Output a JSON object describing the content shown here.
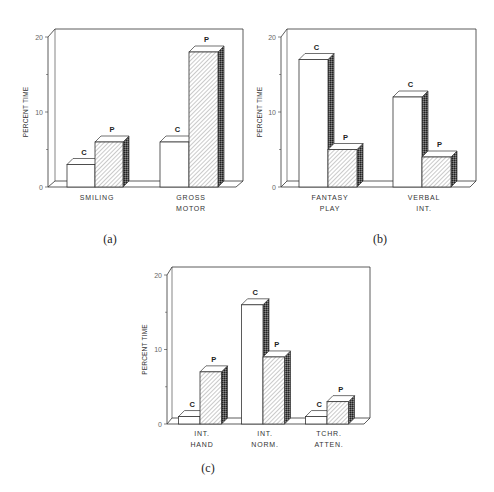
{
  "chart_data": [
    {
      "id": "a",
      "type": "bar",
      "caption": "(a)",
      "title": "",
      "xlabel": "",
      "ylabel": "PERCENT TIME",
      "ylim": [
        0,
        20
      ],
      "yticks": [
        "0",
        "10",
        "20"
      ],
      "categories": [
        "SMILING",
        "GROSS MOTOR"
      ],
      "category_lines": [
        [
          "SMILING"
        ],
        [
          "GROSS",
          "MOTOR"
        ]
      ],
      "series": [
        {
          "name": "C",
          "style": "white",
          "values": [
            3,
            6
          ]
        },
        {
          "name": "P",
          "style": "hatched",
          "values": [
            6,
            18
          ]
        }
      ],
      "grid": false,
      "legend": "bar-top letters"
    },
    {
      "id": "b",
      "type": "bar",
      "caption": "(b)",
      "title": "",
      "xlabel": "",
      "ylabel": "PERCENT TIME",
      "ylim": [
        0,
        20
      ],
      "yticks": [
        "0",
        "10",
        "20"
      ],
      "categories": [
        "FANTASY PLAY",
        "VERBAL INT."
      ],
      "category_lines": [
        [
          "FANTASY",
          "PLAY"
        ],
        [
          "VERBAL",
          "INT."
        ]
      ],
      "series": [
        {
          "name": "C",
          "style": "white",
          "values": [
            17,
            12
          ]
        },
        {
          "name": "P",
          "style": "hatched",
          "values": [
            5,
            4
          ]
        }
      ],
      "grid": false,
      "legend": "bar-top letters"
    },
    {
      "id": "c",
      "type": "bar",
      "caption": "(c)",
      "title": "",
      "xlabel": "",
      "ylabel": "PERCENT TIME",
      "ylim": [
        0,
        20
      ],
      "yticks": [
        "0",
        "10",
        "20"
      ],
      "categories": [
        "INT. HAND",
        "INT. NORM.",
        "TCHR. ATTEN."
      ],
      "category_lines": [
        [
          "INT.",
          "HAND"
        ],
        [
          "INT.",
          "NORM."
        ],
        [
          "TCHR.",
          "ATTEN."
        ]
      ],
      "series": [
        {
          "name": "C",
          "style": "white",
          "values": [
            1,
            16,
            1
          ]
        },
        {
          "name": "P",
          "style": "hatched",
          "values": [
            7,
            9,
            3
          ]
        }
      ],
      "grid": false,
      "legend": "bar-top letters"
    }
  ],
  "colors": {
    "line": "#333333",
    "bar_fill": "#ffffff",
    "hatch": "#8a8a8a",
    "side_dark": "#3a3a3a"
  }
}
